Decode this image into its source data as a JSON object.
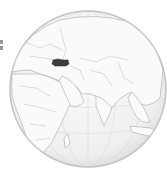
{
  "map": {
    "projection": "orthographic",
    "view_center": "Middle East / Indian Ocean",
    "highlighted_region": "Turkey",
    "colors": {
      "ocean": "#f2f2f2",
      "land": "#fafafa",
      "borders": "#9a9a9a",
      "highlight": "#3c3c3c",
      "graticule": "#d6d6d6",
      "rim": "#c8c8c8"
    },
    "globe": {
      "cx": 88,
      "cy": 89,
      "r": 78
    }
  },
  "edge_fragment": {
    "description": "cropped element at left edge"
  }
}
